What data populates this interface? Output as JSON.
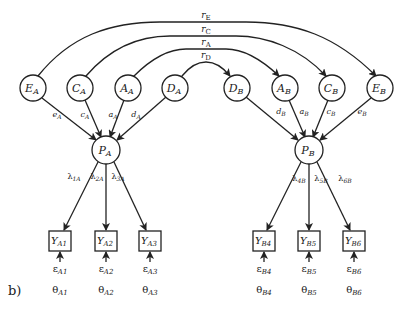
{
  "panel_label": "b)",
  "colors": {
    "stroke": "#222222",
    "background": "#ffffff"
  },
  "correlations": [
    {
      "id": "rE",
      "label": "r",
      "sub": "E",
      "from": "E_A",
      "to": "E_B"
    },
    {
      "id": "rC",
      "label": "r",
      "sub": "C",
      "from": "C_A",
      "to": "C_B"
    },
    {
      "id": "rA",
      "label": "r",
      "sub": "A",
      "from": "A_A",
      "to": "A_B"
    },
    {
      "id": "rD",
      "label": "r",
      "sub": "D",
      "from": "D_A",
      "to": "D_B"
    }
  ],
  "latent_factors": [
    {
      "id": "E_A",
      "main": "E",
      "sub": "A"
    },
    {
      "id": "C_A",
      "main": "C",
      "sub": "A"
    },
    {
      "id": "A_A",
      "main": "A",
      "sub": "A"
    },
    {
      "id": "D_A",
      "main": "D",
      "sub": "A"
    },
    {
      "id": "D_B",
      "main": "D",
      "sub": "B"
    },
    {
      "id": "A_B",
      "main": "A",
      "sub": "B"
    },
    {
      "id": "C_B",
      "main": "C",
      "sub": "B"
    },
    {
      "id": "E_B",
      "main": "E",
      "sub": "B"
    }
  ],
  "factor_paths": [
    {
      "from": "E_A",
      "main": "e",
      "sub": "A"
    },
    {
      "from": "C_A",
      "main": "c",
      "sub": "A"
    },
    {
      "from": "A_A",
      "main": "a",
      "sub": "A"
    },
    {
      "from": "D_A",
      "main": "d",
      "sub": "A"
    },
    {
      "from": "D_B",
      "main": "d",
      "sub": "B"
    },
    {
      "from": "A_B",
      "main": "a",
      "sub": "B"
    },
    {
      "from": "C_B",
      "main": "c",
      "sub": "B"
    },
    {
      "from": "E_B",
      "main": "e",
      "sub": "B"
    }
  ],
  "phenotypes": [
    {
      "id": "P_A",
      "main": "P",
      "sub": "A"
    },
    {
      "id": "P_B",
      "main": "P",
      "sub": "B"
    }
  ],
  "loadings": [
    {
      "main": "λ",
      "sub": "1A"
    },
    {
      "main": "λ",
      "sub": "2A"
    },
    {
      "main": "λ",
      "sub": "3A"
    },
    {
      "main": "λ",
      "sub": "4B"
    },
    {
      "main": "λ",
      "sub": "5B"
    },
    {
      "main": "λ",
      "sub": "6B"
    }
  ],
  "indicators": [
    {
      "main": "Y",
      "sub": "A1"
    },
    {
      "main": "Y",
      "sub": "A2"
    },
    {
      "main": "Y",
      "sub": "A3"
    },
    {
      "main": "Y",
      "sub": "B4"
    },
    {
      "main": "Y",
      "sub": "B5"
    },
    {
      "main": "Y",
      "sub": "B6"
    }
  ],
  "residuals": [
    {
      "main": "ε",
      "sub": "A1"
    },
    {
      "main": "ε",
      "sub": "A2"
    },
    {
      "main": "ε",
      "sub": "A3"
    },
    {
      "main": "ε",
      "sub": "B4"
    },
    {
      "main": "ε",
      "sub": "B5"
    },
    {
      "main": "ε",
      "sub": "B6"
    }
  ],
  "residual_variances": [
    {
      "main": "θ",
      "sub": "A1"
    },
    {
      "main": "θ",
      "sub": "A2"
    },
    {
      "main": "θ",
      "sub": "A3"
    },
    {
      "main": "θ",
      "sub": "B4"
    },
    {
      "main": "θ",
      "sub": "B5"
    },
    {
      "main": "θ",
      "sub": "B6"
    }
  ]
}
